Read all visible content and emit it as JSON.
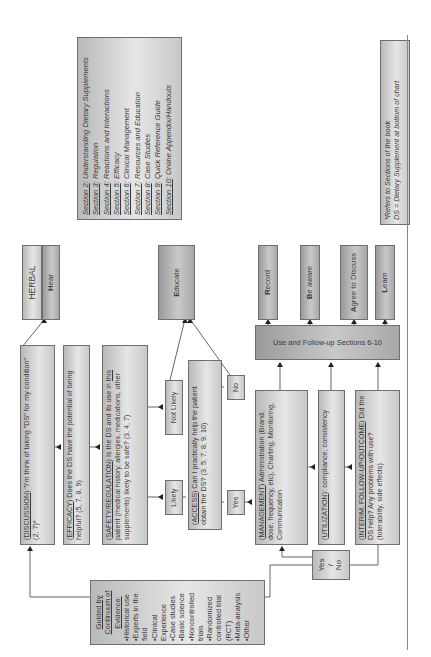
{
  "sections_box": {
    "items": [
      {
        "label": "Section 2",
        "text": ": Understanding Dietary Supplements"
      },
      {
        "label": "Section 3",
        "text": ": Regulation"
      },
      {
        "label": "Section 4",
        "text": ": Reactions and Interactions"
      },
      {
        "label": "Section 5",
        "text": ": Efficacy"
      },
      {
        "label": "Section 6",
        "text": ": Clinical Management"
      },
      {
        "label": "Section 7",
        "text": ": Resources and Education"
      },
      {
        "label": "Section 8",
        "text": ": Case Studies"
      },
      {
        "label": "Section 9",
        "text": ": Quick Reference Guide"
      },
      {
        "label": "Section 10",
        "text": ": Online Appendix/Handouts"
      }
    ]
  },
  "footnote": {
    "line1": "*Refers to Sections of the book",
    "line2": "DS = Dietary Supplement at bottom of chart"
  },
  "herbal": {
    "title": "HERBAL",
    "step_letter": "H",
    "step_rest": "ear"
  },
  "steps": {
    "discussion": {
      "tag": "DISCUSSION",
      "text": ") \"I'm think of taking \"DS\" for my condition\" (2, 7)*"
    },
    "efficacy": {
      "tag": "EFFICACY",
      "text": ") Does the DS have the potential of being helpful? (5, 7, 8, 9)"
    },
    "safety": {
      "tag": "SAFETY/REGULATION",
      "text1": ") Is the DS and its use in ",
      "this": "this",
      "text2": " patient (medical history, allergies, medications, other supplements) likely to be safe? (3, 4, 7)"
    },
    "access": {
      "tag": "ACCESS",
      "text": ") Can I practically help the patient obtain the DS? (3, 5, 7, 8, 9, 10)"
    },
    "management": {
      "tag": "MANAGEMENT",
      "text": ") Administration (Brand, dose, frequency, etc), Charting, Monitoring, Communication"
    },
    "utilization": {
      "tag": "UTILIZATION",
      "text": "): compliance, consistency"
    },
    "interim": {
      "tag": "INTERIM, FOLLOW-UP/OUTCOME",
      "text": ") Did the DS help? Any problems with use? (tolerability, side effects)"
    }
  },
  "decisions": {
    "likely": "Likely",
    "not_likely": "Not Likely",
    "yes": "Yes",
    "no": "No",
    "yes_no_top": "Yes",
    "yes_no_slash": "/",
    "yes_no_bottom": "No"
  },
  "outcomes": {
    "educate": {
      "letter": "E",
      "rest": "ducate"
    },
    "record": {
      "letter": "R",
      "rest": "ecord"
    },
    "be_aware": {
      "letter": "B",
      "rest": "e aware"
    },
    "agree": {
      "letter": "A",
      "rest": "gree to Discuss"
    },
    "learn": {
      "letter": "L",
      "rest": "earn"
    }
  },
  "use_followup_bar": "Use and Follow-up Sections 6-10",
  "evidence": {
    "title_line1": "Guided by",
    "title_line2": "Continuum of",
    "title_line3": "Evidence:",
    "items": [
      "•Historical use",
      "•Experts in the field",
      "•Clinical Experience",
      "•Case studies",
      "•Basic science",
      "•Noncontrolled trials",
      "•Randomized controlled trial (RCT)",
      "•Meta-analysis",
      "•Other"
    ]
  }
}
